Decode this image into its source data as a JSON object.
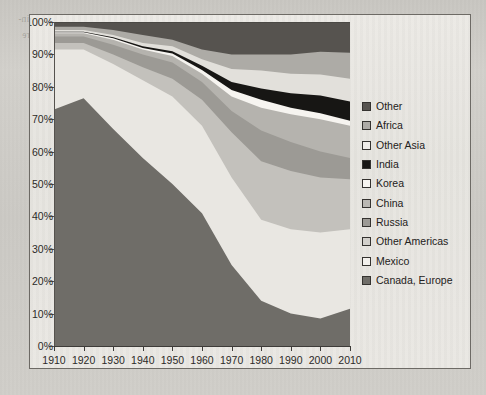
{
  "page": {
    "background_color": "#cfcdc8",
    "frame_color": "#6d6a65",
    "plot_background": "#e8e6e1",
    "bleed_text": [
      "ernment was to pay more attention to the problems of communities in an adjoin-",
      "ber could no more",
      "nge around the",
      "ate of the",
      "to the center",
      "ple through",
      "ny internation",
      "t improve",
      "global",
      "ouths",
      "W pris",
      "tion of",
      "the",
      "pulat",
      "profou",
      "and into the house",
      "ut there had also be"
    ]
  },
  "chart_data": {
    "type": "area",
    "stacked": true,
    "normalized_percent": true,
    "title": "",
    "xlabel": "",
    "ylabel": "",
    "xlim": [
      1910,
      2010
    ],
    "ylim": [
      0,
      100
    ],
    "grid": false,
    "legend_position": "right",
    "x": [
      1910,
      1920,
      1930,
      1940,
      1950,
      1960,
      1970,
      1980,
      1990,
      2000,
      2010
    ],
    "x_tick_labels": [
      "1910",
      "1920",
      "1930",
      "1940",
      "1950",
      "1960",
      "1970",
      "1980",
      "1990",
      "2000",
      "2010"
    ],
    "y_tick_labels": [
      "0%",
      "10%",
      "20%",
      "30%",
      "40%",
      "50%",
      "60%",
      "70%",
      "80%",
      "90%",
      "100%"
    ],
    "y_ticks": [
      0,
      10,
      20,
      30,
      40,
      50,
      60,
      70,
      80,
      90,
      100
    ],
    "stack_order_bottom_to_top": [
      "Canada, Europe",
      "Mexico",
      "Other Americas",
      "Russia",
      "China",
      "Korea",
      "India",
      "Other Asia",
      "Africa",
      "Other"
    ],
    "series": [
      {
        "name": "Canada, Europe",
        "color": "#6f6d68",
        "swatch_color": "#6f6d68",
        "values": [
          73.0,
          76.5,
          67.0,
          58.0,
          50.0,
          41.0,
          25.0,
          14.0,
          10.0,
          8.5,
          11.5
        ]
      },
      {
        "name": "Mexico",
        "color": "#e9e7e2",
        "swatch_color": "#f2f0ec",
        "values": [
          18.5,
          15.0,
          20.0,
          24.0,
          27.0,
          27.0,
          27.0,
          25.0,
          26.0,
          26.5,
          24.5
        ]
      },
      {
        "name": "Other Americas",
        "color": "#c3c1bc",
        "swatch_color": "#d2d0cb",
        "values": [
          2.0,
          2.0,
          3.0,
          4.0,
          5.5,
          8.0,
          14.0,
          18.0,
          18.0,
          17.0,
          15.5
        ]
      },
      {
        "name": "Russia",
        "color": "#9c9a95",
        "swatch_color": "#9c9a95",
        "values": [
          2.0,
          2.0,
          3.0,
          4.0,
          5.0,
          5.5,
          6.5,
          9.5,
          9.0,
          8.0,
          6.5
        ]
      },
      {
        "name": "China",
        "color": "#b5b3ae",
        "swatch_color": "#bab8b3",
        "values": [
          1.0,
          1.0,
          1.5,
          1.5,
          2.0,
          2.5,
          4.5,
          7.0,
          8.5,
          10.0,
          10.0
        ]
      },
      {
        "name": "Korea",
        "color": "#f6f4f0",
        "swatch_color": "#f7f5f1",
        "values": [
          0.3,
          0.3,
          0.5,
          0.5,
          0.8,
          1.2,
          2.0,
          2.5,
          2.0,
          1.8,
          1.5
        ]
      },
      {
        "name": "India",
        "color": "#171614",
        "swatch_color": "#171614",
        "values": [
          0.2,
          0.2,
          0.3,
          0.5,
          0.7,
          1.3,
          2.5,
          3.5,
          4.5,
          5.5,
          6.0
        ]
      },
      {
        "name": "Other Asia",
        "color": "#e2e0db",
        "swatch_color": "#eeece8",
        "values": [
          0.5,
          0.5,
          0.7,
          1.0,
          1.5,
          2.0,
          4.0,
          5.5,
          6.0,
          6.5,
          7.0
        ]
      },
      {
        "name": "Africa",
        "color": "#adaba6",
        "swatch_color": "#adaba6",
        "values": [
          1.0,
          1.0,
          1.5,
          2.5,
          2.0,
          3.0,
          4.5,
          5.0,
          6.0,
          7.0,
          8.0
        ]
      },
      {
        "name": "Other",
        "color": "#56534f",
        "swatch_color": "#56534f",
        "values": [
          1.5,
          1.5,
          2.5,
          4.0,
          5.5,
          8.5,
          10.0,
          10.0,
          10.0,
          9.2,
          9.5
        ]
      }
    ]
  },
  "legend": {
    "items": [
      {
        "label": "Other",
        "color": "#56534f"
      },
      {
        "label": "Africa",
        "color": "#adaba6"
      },
      {
        "label": "Other Asia",
        "color": "#eeece8"
      },
      {
        "label": "India",
        "color": "#171614"
      },
      {
        "label": "Korea",
        "color": "#f7f5f1"
      },
      {
        "label": "China",
        "color": "#bab8b3"
      },
      {
        "label": "Russia",
        "color": "#9c9a95"
      },
      {
        "label": "Other Americas",
        "color": "#d2d0cb"
      },
      {
        "label": "Mexico",
        "color": "#f2f0ec"
      },
      {
        "label": "Canada, Europe",
        "color": "#6f6d68"
      }
    ]
  }
}
